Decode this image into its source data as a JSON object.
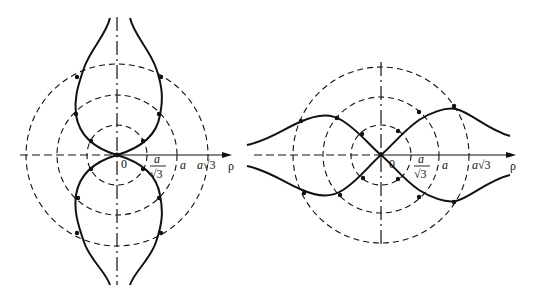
{
  "figure": {
    "colors": {
      "line": "#111111",
      "background": "#ffffff"
    },
    "left_diagram": {
      "origin_label": "0",
      "axis_label": "ρ",
      "tick_labels": {
        "r1_num": "a",
        "r1_den": "√3",
        "r2": "a",
        "r3_a": "a",
        "r3_root": "√3"
      },
      "circles": [
        "a/√3",
        "a",
        "a√3"
      ]
    },
    "right_diagram": {
      "origin_label": "0",
      "axis_label": "ρ",
      "tick_labels": {
        "r1_num": "a",
        "r1_den": "√3",
        "r2": "a",
        "r3_a": "a",
        "r3_root": "√3"
      },
      "circles": [
        "a/√3",
        "a",
        "a√3"
      ]
    }
  }
}
